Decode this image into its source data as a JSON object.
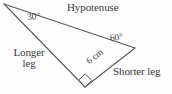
{
  "figure": {
    "background_color": "#fefefe",
    "stroke_color": "#5a5a5a",
    "text_color": "#3a3a3a",
    "vertices": {
      "left": [
        4,
        4
      ],
      "right": [
        135,
        48
      ],
      "bottom": [
        85,
        87
      ]
    },
    "sides": [
      {
        "name": "hypotenuse",
        "from": "left",
        "to": "right",
        "label": "Hypotenuse"
      },
      {
        "name": "longer-leg",
        "from": "left",
        "to": "bottom",
        "label": "Longer leg"
      },
      {
        "name": "shorter-leg",
        "from": "bottom",
        "to": "right",
        "label": "Shorter leg",
        "measure": "6 cm"
      }
    ],
    "angles": [
      {
        "name": "angle-left",
        "vertex": "left",
        "value": "30°"
      },
      {
        "name": "angle-right",
        "vertex": "right",
        "value": "60°"
      },
      {
        "name": "angle-bottom",
        "vertex": "bottom",
        "value": "90°",
        "marker": "right-angle-square"
      }
    ]
  },
  "labels": {
    "hypotenuse": "Hypotenuse",
    "longer_leg_line1": "Longer",
    "longer_leg_line2": "leg",
    "shorter_leg": "Shorter leg",
    "side_measure": "6 cm",
    "angle_30": "30°",
    "angle_60": "60°"
  }
}
